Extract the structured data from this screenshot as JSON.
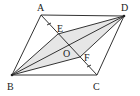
{
  "diagram": {
    "type": "geometry-parallelogram",
    "points": {
      "A": {
        "label": "A",
        "x": 41,
        "y": 15
      },
      "B": {
        "label": "B",
        "x": 12,
        "y": 75
      },
      "C": {
        "label": "C",
        "x": 97,
        "y": 75
      },
      "D": {
        "label": "D",
        "x": 124,
        "y": 16
      },
      "E": {
        "label": "E",
        "x": 58,
        "y": 34
      },
      "O": {
        "label": "O",
        "x": 69,
        "y": 46
      },
      "F": {
        "label": "F",
        "x": 80,
        "y": 57
      }
    },
    "label_positions": {
      "A": {
        "x": 37,
        "y": 11
      },
      "B": {
        "x": 7,
        "y": 89
      },
      "C": {
        "x": 93,
        "y": 89
      },
      "D": {
        "x": 122,
        "y": 11
      },
      "E": {
        "x": 58,
        "y": 32
      },
      "O": {
        "x": 63,
        "y": 57
      },
      "F": {
        "x": 84,
        "y": 60
      }
    },
    "segments": [
      "AB",
      "BC",
      "CD",
      "DA",
      "AC",
      "BD",
      "BE",
      "ED",
      "BF",
      "FD"
    ],
    "shaded_region": [
      "B",
      "E",
      "D",
      "F"
    ],
    "equal_tick_marks": [
      "AE",
      "FC"
    ],
    "colors": {
      "line": "#333333",
      "shade": "#e6e6e6"
    }
  }
}
